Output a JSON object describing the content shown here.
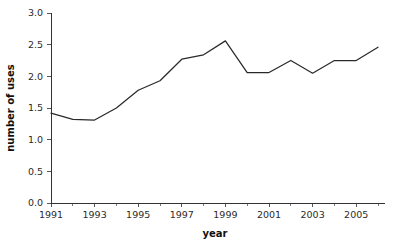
{
  "chart_data": {
    "type": "line",
    "title": "",
    "xlabel": "year",
    "ylabel": "number of uses",
    "xlim": [
      1991,
      2006
    ],
    "ylim": [
      0.0,
      3.0
    ],
    "grid": false,
    "legend": "none",
    "x": [
      1991,
      1992,
      1993,
      1994,
      1995,
      1996,
      1997,
      1998,
      1999,
      2000,
      2001,
      2002,
      2003,
      2004,
      2005,
      2006
    ],
    "values": [
      1.42,
      1.32,
      1.31,
      1.5,
      1.78,
      1.93,
      2.27,
      2.34,
      2.56,
      2.06,
      2.06,
      2.25,
      2.05,
      2.25,
      2.25,
      2.46
    ],
    "series": [
      {
        "name": "number of uses",
        "color": "#2a2a2a",
        "values": [
          1.42,
          1.32,
          1.31,
          1.5,
          1.78,
          1.93,
          2.27,
          2.34,
          2.56,
          2.06,
          2.06,
          2.25,
          2.05,
          2.25,
          2.25,
          2.46
        ]
      }
    ],
    "x_tick_labels": [
      "1991",
      "1993",
      "1995",
      "1997",
      "1999",
      "2001",
      "2003",
      "2005"
    ],
    "x_tick_values": [
      1991,
      1993,
      1995,
      1997,
      1999,
      2001,
      2003,
      2005
    ],
    "x_minor_ticks": [
      1992,
      1994,
      1996,
      1998,
      2000,
      2002,
      2004,
      2006
    ],
    "y_tick_labels": [
      "0.0",
      "0.5",
      "1.0",
      "1.5",
      "2.0",
      "2.5",
      "3.0"
    ],
    "y_tick_values": [
      0.0,
      0.5,
      1.0,
      1.5,
      2.0,
      2.5,
      3.0
    ],
    "axis_color": "#333333",
    "background_color": "#ffffff"
  }
}
